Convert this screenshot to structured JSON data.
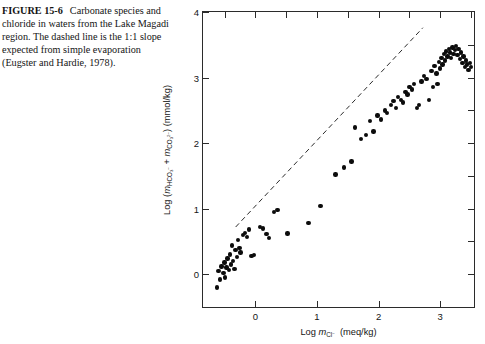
{
  "caption": {
    "figure_label": "FIGURE 15-6",
    "text": "Carbonate species and chloride in waters from the Lake Magadi region. The dashed line is the 1:1 slope expected from simple evaporation (Eugster and Hardie, 1978)."
  },
  "axis": {
    "x_title_prefix": "Log ",
    "x_title_m": "m",
    "x_title_sub": "Cl",
    "x_title_sup": "−",
    "x_title_units": " (meq/kg)",
    "y_title": "Log (mHCO3- + mCO3 2-) (mmol/kg)"
  },
  "chart_data": {
    "type": "scatter",
    "title": "",
    "xlabel": "Log m_Cl- (meq/kg)",
    "ylabel": "Log (m_HCO3- + m_CO3 2-) (mmol/kg)",
    "xlim": [
      -0.85,
      3.55
    ],
    "ylim": [
      -0.5,
      4.0
    ],
    "xticks": [
      0,
      1,
      2,
      3
    ],
    "yticks": [
      0,
      1,
      2,
      3,
      4
    ],
    "xtick_labels": [
      "0",
      "1",
      "2",
      "3"
    ],
    "ytick_labels": [
      "0",
      "1",
      "2",
      "3",
      "4"
    ],
    "grid": false,
    "legend": null,
    "minor_ticks_top": [
      -0.5,
      0.5,
      1.5,
      2.5,
      3.5
    ],
    "minor_ticks_right": [
      0.5,
      1.5,
      2.5,
      3.5
    ],
    "annotations": [
      {
        "type": "line",
        "style": "dashed",
        "label": "1:1 slope expected from simple evaporation",
        "x0": -0.32,
        "y0": 0.72,
        "x1": 2.72,
        "y1": 3.76
      }
    ],
    "series": [
      {
        "name": "Lake Magadi region waters",
        "marker": "filled-circle",
        "color": "#0c0c0c",
        "points": [
          [
            -0.62,
            -0.2
          ],
          [
            -0.6,
            0.05
          ],
          [
            -0.57,
            -0.08
          ],
          [
            -0.55,
            0.12
          ],
          [
            -0.52,
            0.02
          ],
          [
            -0.5,
            0.18
          ],
          [
            -0.49,
            -0.05
          ],
          [
            -0.47,
            0.1
          ],
          [
            -0.45,
            0.24
          ],
          [
            -0.43,
            0.06
          ],
          [
            -0.41,
            0.3
          ],
          [
            -0.4,
            0.15
          ],
          [
            -0.38,
            0.44
          ],
          [
            -0.36,
            0.2
          ],
          [
            -0.34,
            0.08
          ],
          [
            -0.32,
            0.37
          ],
          [
            -0.3,
            0.26
          ],
          [
            -0.28,
            0.52
          ],
          [
            -0.26,
            0.4
          ],
          [
            -0.24,
            0.33
          ],
          [
            -0.2,
            0.6
          ],
          [
            -0.17,
            0.63
          ],
          [
            -0.14,
            0.57
          ],
          [
            -0.1,
            0.68
          ],
          [
            -0.06,
            0.28
          ],
          [
            -0.02,
            0.29
          ],
          [
            0.08,
            0.72
          ],
          [
            0.12,
            0.7
          ],
          [
            0.18,
            0.61
          ],
          [
            0.22,
            0.55
          ],
          [
            0.3,
            0.95
          ],
          [
            0.36,
            0.98
          ],
          [
            0.52,
            0.62
          ],
          [
            0.86,
            0.78
          ],
          [
            1.06,
            1.04
          ],
          [
            1.3,
            1.52
          ],
          [
            1.44,
            1.63
          ],
          [
            1.56,
            1.72
          ],
          [
            1.62,
            2.24
          ],
          [
            1.72,
            2.06
          ],
          [
            1.8,
            2.12
          ],
          [
            1.86,
            2.34
          ],
          [
            1.92,
            2.18
          ],
          [
            1.98,
            2.42
          ],
          [
            2.04,
            2.36
          ],
          [
            2.1,
            2.5
          ],
          [
            2.14,
            2.46
          ],
          [
            2.2,
            2.58
          ],
          [
            2.24,
            2.64
          ],
          [
            2.28,
            2.54
          ],
          [
            2.32,
            2.7
          ],
          [
            2.36,
            2.66
          ],
          [
            2.4,
            2.62
          ],
          [
            2.44,
            2.78
          ],
          [
            2.47,
            2.74
          ],
          [
            2.5,
            2.86
          ],
          [
            2.54,
            2.82
          ],
          [
            2.58,
            2.9
          ],
          [
            2.62,
            2.54
          ],
          [
            2.66,
            2.58
          ],
          [
            2.7,
            2.94
          ],
          [
            2.74,
            3.02
          ],
          [
            2.78,
            2.98
          ],
          [
            2.82,
            2.66
          ],
          [
            2.86,
            3.1
          ],
          [
            2.88,
            2.86
          ],
          [
            2.91,
            3.18
          ],
          [
            2.94,
            3.06
          ],
          [
            2.96,
            2.9
          ],
          [
            2.98,
            3.24
          ],
          [
            3.0,
            3.14
          ],
          [
            3.02,
            3.3
          ],
          [
            3.04,
            3.2
          ],
          [
            3.06,
            3.36
          ],
          [
            3.08,
            3.26
          ],
          [
            3.1,
            3.4
          ],
          [
            3.12,
            3.32
          ],
          [
            3.14,
            3.44
          ],
          [
            3.16,
            3.38
          ],
          [
            3.18,
            3.3
          ],
          [
            3.2,
            3.46
          ],
          [
            3.22,
            3.36
          ],
          [
            3.24,
            3.42
          ],
          [
            3.26,
            3.48
          ],
          [
            3.28,
            3.34
          ],
          [
            3.3,
            3.44
          ],
          [
            3.32,
            3.28
          ],
          [
            3.34,
            3.38
          ],
          [
            3.36,
            3.22
          ],
          [
            3.38,
            3.32
          ],
          [
            3.4,
            3.16
          ],
          [
            3.42,
            3.26
          ],
          [
            3.44,
            3.2
          ],
          [
            3.46,
            3.12
          ],
          [
            3.48,
            3.22
          ],
          [
            3.5,
            3.16
          ]
        ]
      }
    ]
  }
}
